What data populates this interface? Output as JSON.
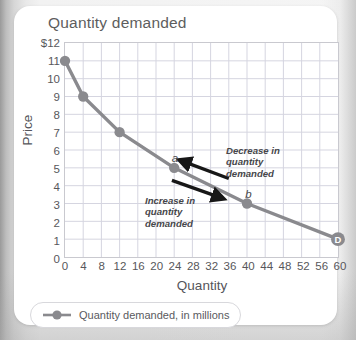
{
  "card": {
    "title": "Quantity demanded"
  },
  "legend": {
    "label": "Quantity demanded, in millions",
    "marker_color": "#8a8a8e"
  },
  "annotations": [
    {
      "id": "decrease",
      "line1": "Decrease in",
      "line2": "quantity",
      "line3": "demanded"
    },
    {
      "id": "increase",
      "line1": "Increase in",
      "line2": "quantity",
      "line3": "demanded"
    }
  ],
  "point_labels": [
    {
      "id": "a",
      "text": "a",
      "x": 24,
      "y": 5
    },
    {
      "id": "b",
      "text": "b",
      "x": 40,
      "y": 3
    }
  ],
  "curve_label": {
    "text": "D",
    "x": 60,
    "y": 1
  },
  "colors": {
    "line": "#8a8a8e",
    "marker": "#8a8a8e",
    "grid": "#d5d5e0",
    "frame": "#c9c9cf",
    "arrow": "#171717",
    "text": "#55555a"
  },
  "chart_data": {
    "type": "line",
    "title": "Quantity demanded",
    "xlabel": "Quantity",
    "ylabel": "Price",
    "xlim": [
      0,
      60
    ],
    "ylim": [
      0,
      12
    ],
    "grid": true,
    "legend_position": "bottom-left",
    "xticks": [
      0,
      4,
      8,
      12,
      16,
      20,
      24,
      28,
      32,
      36,
      40,
      44,
      48,
      52,
      56,
      60
    ],
    "xtick_labels": [
      "0",
      "4",
      "8",
      "12",
      "16",
      "20",
      "24",
      "28",
      "32",
      "36",
      "40",
      "44",
      "48",
      "52",
      "56",
      "60"
    ],
    "yticks": [
      0,
      1,
      2,
      3,
      4,
      5,
      6,
      7,
      8,
      9,
      10,
      11,
      12
    ],
    "ytick_labels": [
      "0",
      "1",
      "2",
      "3",
      "4",
      "5",
      "6",
      "7",
      "8",
      "9",
      "10",
      "11",
      "$12"
    ],
    "series": [
      {
        "name": "Quantity demanded, in millions",
        "x": [
          0,
          4,
          12,
          24,
          40,
          60
        ],
        "values": [
          11,
          9,
          7,
          5,
          3,
          1
        ],
        "color": "#8a8a8e",
        "marker": "circle"
      }
    ],
    "annotations": [
      {
        "text": "Decrease in quantity demanded",
        "arrow_from": [
          36,
          4.4
        ],
        "arrow_to": [
          25.5,
          5.4
        ]
      },
      {
        "text": "Increase in quantity demanded",
        "arrow_from": [
          23.5,
          4.3
        ],
        "arrow_to": [
          34.5,
          3.3
        ]
      }
    ]
  }
}
